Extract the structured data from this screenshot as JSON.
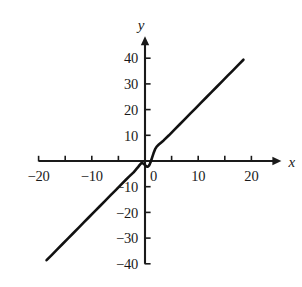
{
  "chart_data": {
    "type": "line",
    "title": "",
    "subtitle": "",
    "xlabel": "x",
    "ylabel": "y",
    "xlim": [
      -20,
      20
    ],
    "ylim": [
      -40,
      40
    ],
    "grid": false,
    "legend": null,
    "legend_position": "none",
    "x_major_step": 5,
    "x_label_step": 10,
    "y_major_step": 10,
    "y_label_step": 10,
    "x_tick_values": [
      -20,
      -15,
      -10,
      -5,
      0,
      5,
      10,
      15,
      20
    ],
    "y_tick_values": [
      -40,
      -30,
      -20,
      -10,
      0,
      10,
      20,
      30,
      40
    ],
    "x_tick_labels": [
      "−20",
      "",
      "−10",
      "",
      "0",
      "",
      "10",
      "",
      "20"
    ],
    "y_tick_labels": [
      "−40",
      "−30",
      "−20",
      "−10",
      "",
      "10",
      "20",
      "30",
      "40"
    ],
    "origin_label": "0",
    "series": [
      {
        "name": "curve",
        "color": "#111111",
        "x": [
          -18.5,
          -17.5,
          -16.5,
          -15.5,
          -14.5,
          -13.5,
          -12.5,
          -11.5,
          -10.5,
          -9.5,
          -8.5,
          -7.5,
          -6.5,
          -5.5,
          -4.5,
          -3.5,
          -3.0,
          -2.6,
          -2.2,
          -1.9,
          -1.6,
          -1.35,
          -1.1,
          -0.9,
          -0.7,
          -0.5,
          -0.3,
          -0.15,
          0.0,
          0.15,
          0.3,
          0.45,
          0.6,
          0.75,
          0.9,
          1.1,
          1.35,
          1.6,
          1.9,
          2.2,
          2.6,
          3.0,
          3.5,
          4.5,
          5.5,
          6.5,
          7.5,
          8.5,
          9.5,
          10.5,
          11.5,
          12.5,
          13.5,
          14.5,
          15.5,
          16.5,
          17.5,
          18.5
        ],
        "y": [
          -38.6,
          -36.5,
          -34.4,
          -32.3,
          -30.2,
          -28.1,
          -26.0,
          -23.9,
          -21.8,
          -19.7,
          -17.6,
          -15.5,
          -13.4,
          -11.3,
          -9.2,
          -7.1,
          -6.1,
          -5.3,
          -4.5,
          -3.8,
          -3.1,
          -2.5,
          -1.8,
          -1.3,
          -0.9,
          -0.8,
          -1.0,
          -1.3,
          -1.6,
          -1.9,
          -2.1,
          -2.2,
          -2.1,
          -1.8,
          -1.2,
          -0.2,
          1.4,
          3.0,
          4.6,
          5.6,
          6.4,
          7.1,
          8.0,
          10.0,
          12.1,
          14.2,
          16.3,
          18.4,
          20.5,
          22.6,
          24.7,
          26.8,
          28.9,
          31.0,
          33.1,
          35.2,
          37.3,
          39.4
        ]
      }
    ],
    "annotations": [
      {
        "name": "origin-wiggle",
        "description": "S-shaped inflection of the curve near the origin with a local rise before x = -1 and a local dip just after x = 0"
      }
    ]
  },
  "axes": {
    "x_axis_name": "x",
    "y_axis_name": "y"
  }
}
